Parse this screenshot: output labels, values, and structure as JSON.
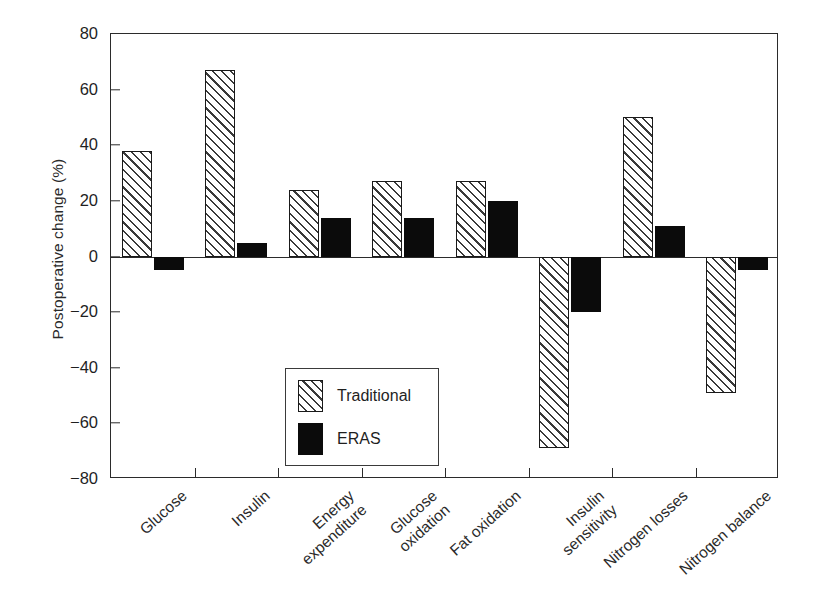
{
  "chart": {
    "type": "bar",
    "title": "",
    "ylabel": "Postoperative change (%)",
    "xlabel": "",
    "ylim": [
      -80,
      80
    ],
    "yticks": [
      80,
      60,
      40,
      20,
      0,
      -20,
      -40,
      -60,
      -80
    ],
    "ytick_labels": [
      "80",
      "60",
      "40",
      "20",
      "0",
      "−20",
      "−40",
      "−60",
      "−80"
    ],
    "grid": false,
    "legend_position": "lower-left-inside",
    "orientation": "vertical",
    "colors": {
      "traditional": "#ffffff",
      "traditional_hatch": "#3a3a3a",
      "eras": "#0b0b0b",
      "axis": "#2b2b2b",
      "text": "#1f1f1f",
      "background": "#ffffff"
    }
  },
  "chart_data": {
    "type": "bar",
    "title": "",
    "xlabel": "",
    "ylabel": "Postoperative change (%)",
    "ylim": [
      -80,
      80
    ],
    "yticks": [
      -80,
      -60,
      -40,
      -20,
      0,
      20,
      40,
      60,
      80
    ],
    "grid": false,
    "legend_position": "lower-left-inside",
    "categories": [
      "Glucose",
      "Insulin",
      "Energy expenditure",
      "Glucose oxidation",
      "Fat oxidation",
      "Insulin sensitivity",
      "Nitrogen losses",
      "Nitrogen balance"
    ],
    "series": [
      {
        "name": "Traditional",
        "values": [
          38,
          67,
          24,
          27,
          27,
          -69,
          50,
          -49
        ]
      },
      {
        "name": "ERAS",
        "values": [
          -5,
          5,
          14,
          14,
          20,
          -20,
          11,
          -5
        ]
      }
    ]
  },
  "categories_display": [
    [
      "Glucose"
    ],
    [
      "Insulin"
    ],
    [
      "Energy",
      "expenditure"
    ],
    [
      "Glucose",
      "oxidation"
    ],
    [
      "Fat oxidation"
    ],
    [
      "Insulin",
      "sensitivity"
    ],
    [
      "Nitrogen losses"
    ],
    [
      "Nitrogen balance"
    ]
  ],
  "legend": {
    "items": [
      {
        "label": "Traditional",
        "style": "hatched"
      },
      {
        "label": "ERAS",
        "style": "solid-black"
      }
    ]
  }
}
